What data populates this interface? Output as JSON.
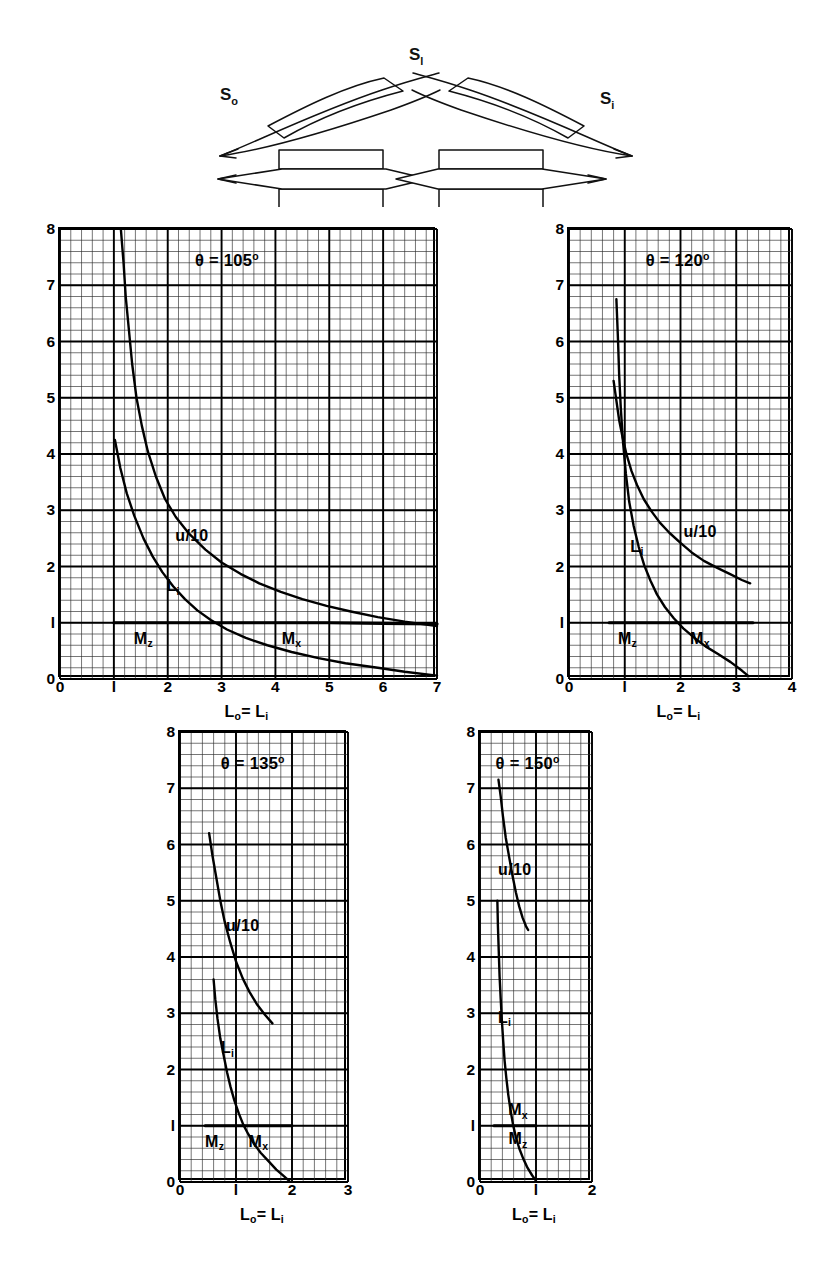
{
  "figure": {
    "diagram": {
      "name": "blade-cascade-schematic",
      "labels": [
        {
          "id": "s-out",
          "text": "S",
          "sub": "o"
        },
        {
          "id": "s-mid",
          "text": "S",
          "sub": "l"
        },
        {
          "id": "s-in",
          "text": "S",
          "sub": "i"
        }
      ]
    },
    "axis_label": "L₀= Lᵢ",
    "axis_label_main": "L",
    "axis_label_sub1": "o",
    "axis_label_eq": "= L",
    "axis_label_sub2": "i",
    "curve_labels": {
      "psi": "u/10",
      "li_main": "L",
      "li_sub": "i",
      "mz_main": "M",
      "mz_sub": "z",
      "mx_main": "M",
      "mx_sub": "x"
    },
    "caption": ""
  },
  "chart_data": [
    {
      "id": "theta-105",
      "type": "line",
      "title": "θ = 105",
      "title_deg": "o",
      "xlabel": "L₀= Lᵢ",
      "ylabel": "",
      "xlim": [
        0,
        7
      ],
      "ylim": [
        0,
        8
      ],
      "xticks": [
        0,
        1,
        2,
        3,
        4,
        5,
        6,
        7
      ],
      "yticks": [
        0,
        1,
        2,
        3,
        4,
        5,
        6,
        7,
        8
      ],
      "xticklabels": [
        "0",
        "1",
        "2",
        "3",
        "4",
        "5",
        "6",
        "7"
      ],
      "yticklabels": [
        "0",
        "1",
        "2",
        "3",
        "4",
        "5",
        "6",
        "7",
        "8"
      ],
      "minor_per_major": 5,
      "grid": true,
      "series": [
        {
          "name": "u/10",
          "label": "u/10",
          "label_at": [
            2.45,
            2.55
          ],
          "points": [
            [
              1.13,
              8.0
            ],
            [
              1.18,
              7.4
            ],
            [
              1.22,
              6.8
            ],
            [
              1.28,
              6.2
            ],
            [
              1.34,
              5.6
            ],
            [
              1.42,
              5.0
            ],
            [
              1.52,
              4.5
            ],
            [
              1.63,
              4.05
            ],
            [
              1.78,
              3.6
            ],
            [
              1.95,
              3.2
            ],
            [
              2.15,
              2.88
            ],
            [
              2.4,
              2.58
            ],
            [
              2.7,
              2.3
            ],
            [
              3.0,
              2.07
            ],
            [
              3.35,
              1.87
            ],
            [
              3.7,
              1.7
            ],
            [
              4.1,
              1.55
            ],
            [
              4.5,
              1.42
            ],
            [
              4.95,
              1.3
            ],
            [
              5.4,
              1.2
            ],
            [
              5.9,
              1.1
            ],
            [
              6.4,
              1.02
            ],
            [
              7.0,
              0.94
            ]
          ]
        },
        {
          "name": "L_i",
          "label": "L",
          "label_sub": "i",
          "label_at": [
            2.1,
            1.65
          ],
          "points": [
            [
              1.02,
              4.25
            ],
            [
              1.12,
              3.75
            ],
            [
              1.24,
              3.3
            ],
            [
              1.38,
              2.9
            ],
            [
              1.55,
              2.5
            ],
            [
              1.72,
              2.18
            ],
            [
              1.9,
              1.9
            ],
            [
              2.1,
              1.65
            ],
            [
              2.32,
              1.42
            ],
            [
              2.55,
              1.22
            ],
            [
              2.8,
              1.05
            ],
            [
              3.1,
              0.88
            ],
            [
              3.45,
              0.73
            ],
            [
              3.85,
              0.6
            ],
            [
              4.3,
              0.48
            ],
            [
              4.8,
              0.37
            ],
            [
              5.3,
              0.28
            ],
            [
              5.9,
              0.2
            ],
            [
              6.4,
              0.13
            ],
            [
              7.0,
              0.06
            ]
          ]
        },
        {
          "name": "M_z/M_x",
          "label_mz": "M",
          "label_mz_sub": "z",
          "label_mz_at": [
            1.55,
            0.72
          ],
          "label_mx": "M",
          "label_mx_sub": "x",
          "label_mx_at": [
            4.3,
            0.72
          ],
          "points": [
            [
              1.0,
              1.0
            ],
            [
              2.0,
              1.0
            ],
            [
              3.0,
              1.0
            ],
            [
              4.0,
              1.0
            ],
            [
              5.0,
              1.0
            ],
            [
              6.0,
              0.99
            ],
            [
              7.0,
              0.98
            ]
          ]
        }
      ]
    },
    {
      "id": "theta-120",
      "type": "line",
      "title": "θ = 120",
      "title_deg": "o",
      "xlabel": "L₀= Lᵢ",
      "ylabel": "",
      "xlim": [
        0,
        4
      ],
      "ylim": [
        0,
        8
      ],
      "xticks": [
        0,
        1,
        2,
        3,
        4
      ],
      "yticks": [
        0,
        1,
        2,
        3,
        4,
        5,
        6,
        7,
        8
      ],
      "xticklabels": [
        "0",
        "1",
        "2",
        "3",
        "4"
      ],
      "yticklabels": [
        "0",
        "1",
        "2",
        "3",
        "4",
        "5",
        "6",
        "7",
        "8"
      ],
      "minor_per_major": 5,
      "grid": true,
      "series": [
        {
          "name": "u/10",
          "label": "u/10",
          "label_at": [
            2.35,
            2.62
          ],
          "points": [
            [
              0.8,
              5.3
            ],
            [
              0.85,
              4.95
            ],
            [
              0.9,
              4.6
            ],
            [
              0.96,
              4.3
            ],
            [
              1.03,
              4.0
            ],
            [
              1.12,
              3.7
            ],
            [
              1.22,
              3.45
            ],
            [
              1.34,
              3.2
            ],
            [
              1.48,
              2.98
            ],
            [
              1.63,
              2.78
            ],
            [
              1.8,
              2.6
            ],
            [
              2.0,
              2.42
            ],
            [
              2.2,
              2.25
            ],
            [
              2.42,
              2.1
            ],
            [
              2.65,
              1.98
            ],
            [
              2.9,
              1.86
            ],
            [
              3.1,
              1.76
            ],
            [
              3.25,
              1.7
            ]
          ]
        },
        {
          "name": "L_i",
          "label": "L",
          "label_sub": "i",
          "label_at": [
            1.22,
            2.35
          ],
          "points": [
            [
              0.85,
              6.75
            ],
            [
              0.88,
              6.0
            ],
            [
              0.9,
              5.4
            ],
            [
              0.93,
              4.8
            ],
            [
              0.97,
              4.2
            ],
            [
              1.02,
              3.65
            ],
            [
              1.08,
              3.15
            ],
            [
              1.16,
              2.72
            ],
            [
              1.25,
              2.35
            ],
            [
              1.35,
              2.02
            ],
            [
              1.46,
              1.75
            ],
            [
              1.58,
              1.5
            ],
            [
              1.72,
              1.28
            ],
            [
              1.88,
              1.08
            ],
            [
              2.05,
              0.9
            ],
            [
              2.25,
              0.73
            ],
            [
              2.45,
              0.58
            ],
            [
              2.68,
              0.44
            ],
            [
              2.9,
              0.3
            ],
            [
              3.1,
              0.15
            ],
            [
              3.22,
              0.05
            ]
          ]
        },
        {
          "name": "M_z/M_x",
          "label_mz": "M",
          "label_mz_sub": "z",
          "label_mz_at": [
            1.05,
            0.72
          ],
          "label_mx": "M",
          "label_mx_sub": "x",
          "label_mx_at": [
            2.35,
            0.72
          ],
          "points": [
            [
              0.72,
              1.0
            ],
            [
              1.5,
              1.0
            ],
            [
              2.2,
              1.0
            ],
            [
              3.0,
              1.0
            ],
            [
              3.3,
              1.0
            ]
          ]
        }
      ]
    },
    {
      "id": "theta-135",
      "type": "line",
      "title": "θ = 135",
      "title_deg": "o",
      "xlabel": "L₀= Lᵢ",
      "ylabel": "",
      "xlim": [
        0,
        3
      ],
      "ylim": [
        0,
        8
      ],
      "xticks": [
        0,
        1,
        2,
        3
      ],
      "yticks": [
        0,
        1,
        2,
        3,
        4,
        5,
        6,
        7,
        8
      ],
      "xticklabels": [
        "0",
        "1",
        "2",
        "3"
      ],
      "yticklabels": [
        "0",
        "1",
        "2",
        "3",
        "4",
        "5",
        "6",
        "7",
        "8"
      ],
      "minor_per_major": 5,
      "grid": true,
      "series": [
        {
          "name": "u/10",
          "label": "u/10",
          "label_at": [
            1.12,
            4.55
          ],
          "points": [
            [
              0.52,
              6.2
            ],
            [
              0.58,
              5.8
            ],
            [
              0.65,
              5.4
            ],
            [
              0.72,
              5.0
            ],
            [
              0.8,
              4.62
            ],
            [
              0.9,
              4.25
            ],
            [
              1.0,
              3.92
            ],
            [
              1.12,
              3.62
            ],
            [
              1.24,
              3.38
            ],
            [
              1.38,
              3.15
            ],
            [
              1.52,
              2.97
            ],
            [
              1.65,
              2.82
            ]
          ]
        },
        {
          "name": "L_i",
          "label": "L",
          "label_sub": "i",
          "label_at": [
            0.85,
            2.38
          ],
          "points": [
            [
              0.6,
              3.6
            ],
            [
              0.63,
              3.25
            ],
            [
              0.67,
              2.9
            ],
            [
              0.72,
              2.55
            ],
            [
              0.78,
              2.25
            ],
            [
              0.84,
              1.95
            ],
            [
              0.9,
              1.7
            ],
            [
              0.97,
              1.45
            ],
            [
              1.05,
              1.22
            ],
            [
              1.13,
              1.02
            ],
            [
              1.22,
              0.85
            ],
            [
              1.32,
              0.68
            ],
            [
              1.44,
              0.52
            ],
            [
              1.58,
              0.37
            ],
            [
              1.72,
              0.22
            ],
            [
              1.86,
              0.1
            ],
            [
              1.95,
              0.02
            ]
          ]
        },
        {
          "name": "M_z/M_x",
          "label_mz": "M",
          "label_mz_sub": "z",
          "label_mz_at": [
            0.62,
            0.72
          ],
          "label_mx": "M",
          "label_mx_sub": "x",
          "label_mx_at": [
            1.4,
            0.72
          ],
          "points": [
            [
              0.45,
              1.0
            ],
            [
              1.0,
              1.0
            ],
            [
              1.6,
              1.0
            ],
            [
              2.0,
              1.0
            ]
          ]
        }
      ]
    },
    {
      "id": "theta-150",
      "type": "line",
      "title": "θ = 150",
      "title_deg": "o",
      "xlabel": "L₀= Lᵢ",
      "ylabel": "",
      "xlim": [
        0,
        2
      ],
      "ylim": [
        0,
        8
      ],
      "xticks": [
        0,
        1,
        2
      ],
      "yticks": [
        0,
        1,
        2,
        3,
        4,
        5,
        6,
        7,
        8
      ],
      "xticklabels": [
        "0",
        "1",
        "2"
      ],
      "yticklabels": [
        "0",
        "1",
        "2",
        "3",
        "4",
        "5",
        "6",
        "7",
        "8"
      ],
      "minor_per_major": 5,
      "grid": true,
      "series": [
        {
          "name": "u/10",
          "label": "u/10",
          "label_at": [
            0.62,
            5.55
          ],
          "points": [
            [
              0.33,
              7.15
            ],
            [
              0.37,
              6.85
            ],
            [
              0.41,
              6.5
            ],
            [
              0.46,
              6.12
            ],
            [
              0.52,
              5.78
            ],
            [
              0.58,
              5.45
            ],
            [
              0.64,
              5.15
            ],
            [
              0.7,
              4.9
            ],
            [
              0.76,
              4.7
            ],
            [
              0.82,
              4.55
            ],
            [
              0.86,
              4.48
            ]
          ]
        },
        {
          "name": "L_i",
          "label": "L",
          "label_sub": "i",
          "label_at": [
            0.44,
            2.92
          ],
          "points": [
            [
              0.31,
              5.0
            ],
            [
              0.32,
              4.55
            ],
            [
              0.335,
              4.1
            ],
            [
              0.35,
              3.65
            ],
            [
              0.37,
              3.25
            ],
            [
              0.39,
              2.88
            ],
            [
              0.415,
              2.5
            ],
            [
              0.44,
              2.15
            ],
            [
              0.47,
              1.85
            ],
            [
              0.505,
              1.55
            ],
            [
              0.545,
              1.28
            ],
            [
              0.59,
              1.02
            ],
            [
              0.64,
              0.8
            ],
            [
              0.7,
              0.6
            ],
            [
              0.77,
              0.42
            ],
            [
              0.85,
              0.25
            ],
            [
              0.93,
              0.12
            ],
            [
              1.0,
              0.02
            ]
          ]
        },
        {
          "name": "M_z/M_x",
          "label_mz": "M",
          "label_mz_sub": "z",
          "label_mz_at": [
            0.68,
            0.76
          ],
          "label_mx": "M",
          "label_mx_sub": "x",
          "label_mx_at": [
            0.68,
            1.28
          ],
          "points": [
            [
              0.25,
              1.0
            ],
            [
              0.6,
              1.0
            ],
            [
              0.85,
              1.0
            ],
            [
              1.0,
              1.0
            ]
          ]
        }
      ]
    }
  ]
}
